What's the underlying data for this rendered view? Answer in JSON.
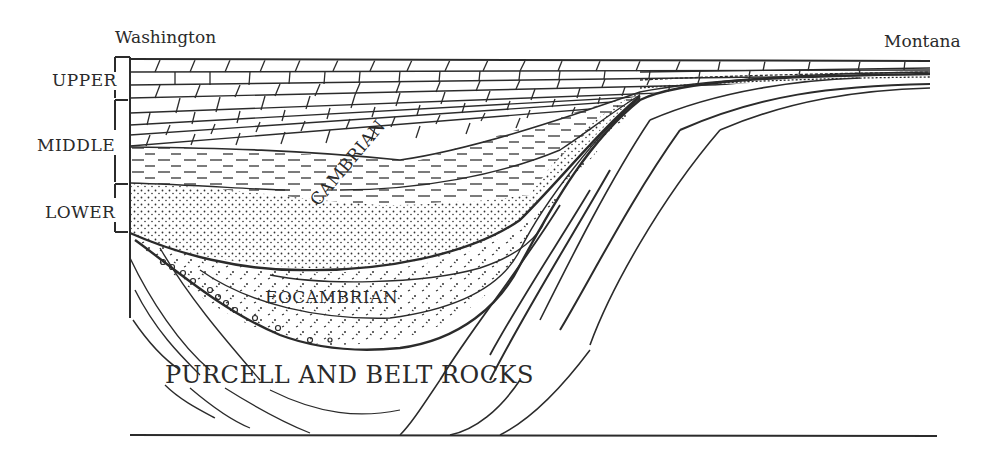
{
  "diagram": {
    "type": "geologic cross-section",
    "locations": {
      "left": "Washington",
      "right": "Montana"
    },
    "series_scale": [
      {
        "label": "UPPER"
      },
      {
        "label": "MIDDLE"
      },
      {
        "label": "LOWER"
      }
    ],
    "units": {
      "cambrian": "CAMBRIAN",
      "eocambrian": "EOCAMBRIAN",
      "basement": "PURCELL AND BELT ROCKS"
    },
    "colors": {
      "ink": "#2b2b2b",
      "background": "#ffffff"
    }
  }
}
